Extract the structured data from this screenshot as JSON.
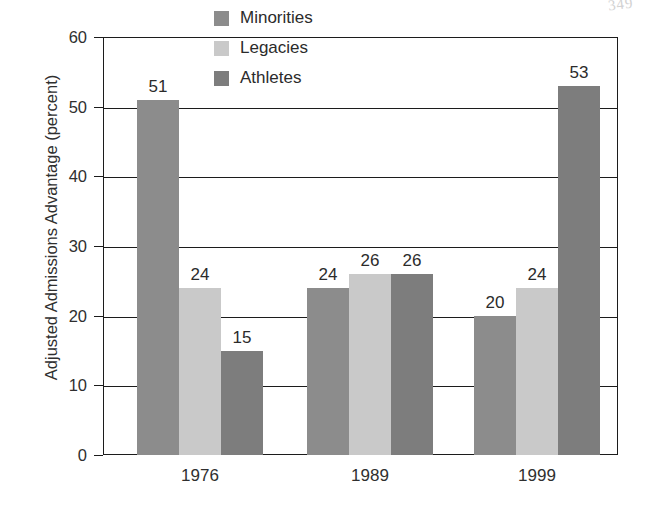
{
  "chart_data": {
    "type": "bar",
    "title": "",
    "subtitle": "",
    "xlabel": "",
    "ylabel": "Adjusted Admissions Advantage (percent)",
    "categories": [
      "1976",
      "1989",
      "1999"
    ],
    "series": [
      {
        "name": "Minorities",
        "color": "#8c8c8c",
        "values": [
          51,
          24,
          20
        ]
      },
      {
        "name": "Legacies",
        "color": "#c9c9c9",
        "values": [
          24,
          26,
          24
        ]
      },
      {
        "name": "Athletes",
        "color": "#7d7d7d",
        "values": [
          15,
          26,
          53
        ]
      }
    ],
    "ylim": [
      0,
      60
    ],
    "yticks": [
      0,
      10,
      20,
      30,
      40,
      50,
      60
    ],
    "ytick_labels": [
      "0",
      "10",
      "20",
      "30",
      "40",
      "50",
      "60"
    ],
    "grid": true,
    "grid_axis": "y",
    "legend_position": "upper center inside plot",
    "value_labels": true,
    "bar_value_labels": [
      "51",
      "24",
      "15",
      "27",
      "26",
      "26",
      "20",
      "24",
      "53"
    ]
  },
  "legend": {
    "items": [
      {
        "label": "Minorities",
        "color": "#8c8c8c"
      },
      {
        "label": "Legacies",
        "color": "#c9c9c9"
      },
      {
        "label": "Athletes",
        "color": "#7d7d7d"
      }
    ]
  },
  "axes": {
    "y_title": "Adjusted Admissions Advantage (percent)",
    "y_ticks": [
      "60",
      "50",
      "40",
      "30",
      "20",
      "10",
      "0"
    ],
    "x_ticks": [
      "1976",
      "1989",
      "1999"
    ]
  },
  "artifact": {
    "scan_mark": "349"
  }
}
